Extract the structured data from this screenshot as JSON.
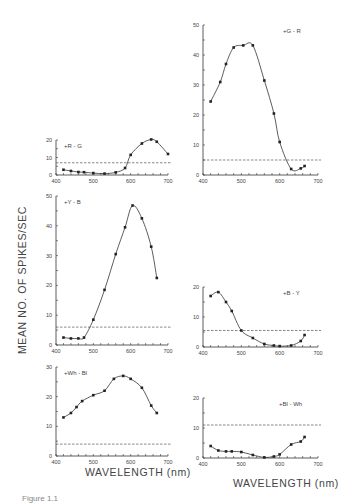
{
  "figure": {
    "ylabel": "MEAN   NO.   OF   SPIKES/SEC",
    "xlabel_left": "WAVELENGTH  (nm)",
    "xlabel_right": "WAVELENGTH  (nm)",
    "caption": "Figure 1.1"
  },
  "chart_data": [
    {
      "type": "line",
      "title": "+R - G",
      "xlabel": "WAVELENGTH (nm)",
      "ylabel": "MEAN NO. OF SPIKES/SEC",
      "xlim": [
        400,
        700
      ],
      "ylim": [
        0,
        20
      ],
      "xticks": [
        400,
        500,
        600,
        700
      ],
      "yticks": [
        0,
        10,
        20
      ],
      "baseline": 7,
      "x": [
        420,
        440,
        460,
        475,
        500,
        530,
        560,
        585,
        600,
        630,
        655,
        670,
        700
      ],
      "values": [
        3,
        2.3,
        1.7,
        1.6,
        1.1,
        0.8,
        1.5,
        4,
        11.5,
        18,
        20.3,
        19,
        12
      ],
      "pixel_box": {
        "x0": 56,
        "x1": 168,
        "y0": 175,
        "y1": 140
      }
    },
    {
      "type": "line",
      "title": "+G - R",
      "xlabel": "WAVELENGTH (nm)",
      "ylabel": "MEAN NO. OF SPIKES/SEC",
      "xlim": [
        400,
        700
      ],
      "ylim": [
        0,
        50
      ],
      "xticks": [
        400,
        500,
        600,
        700
      ],
      "yticks": [
        0,
        10,
        20,
        30,
        40,
        50
      ],
      "baseline": 5,
      "x": [
        420,
        445,
        460,
        480,
        505,
        530,
        560,
        585,
        600,
        630,
        655,
        665
      ],
      "values": [
        24.5,
        31,
        37,
        42.5,
        43.2,
        43.2,
        31.5,
        20.5,
        11,
        2,
        2.2,
        3
      ],
      "pixel_box": {
        "x0": 203,
        "x1": 318,
        "y0": 175,
        "y1": 25
      }
    },
    {
      "type": "line",
      "title": "+Y - B",
      "xlabel": "WAVELENGTH (nm)",
      "ylabel": "MEAN NO. OF SPIKES/SEC",
      "xlim": [
        400,
        700
      ],
      "ylim": [
        0,
        50
      ],
      "xticks": [
        400,
        500,
        600,
        700
      ],
      "yticks": [
        0,
        10,
        20,
        30,
        40,
        50
      ],
      "baseline": 6,
      "x": [
        420,
        440,
        460,
        475,
        500,
        530,
        560,
        585,
        605,
        630,
        655,
        670
      ],
      "values": [
        2.5,
        2.2,
        2.2,
        2.5,
        8.5,
        18.5,
        30.5,
        39.5,
        46.8,
        42.5,
        33,
        22.5
      ],
      "pixel_box": {
        "x0": 56,
        "x1": 168,
        "y0": 345,
        "y1": 196
      }
    },
    {
      "type": "line",
      "title": "+B - Y",
      "xlabel": "WAVELENGTH (nm)",
      "ylabel": "MEAN NO. OF SPIKES/SEC",
      "xlim": [
        400,
        700
      ],
      "ylim": [
        0,
        20
      ],
      "xticks": [
        400,
        500,
        600,
        700
      ],
      "yticks": [
        0,
        10,
        20
      ],
      "baseline": 5.5,
      "x": [
        420,
        440,
        460,
        475,
        500,
        530,
        560,
        585,
        600,
        630,
        655,
        665
      ],
      "values": [
        17,
        18.3,
        15,
        12,
        5.5,
        3,
        1,
        0.5,
        0.3,
        0.5,
        2,
        4
      ],
      "pixel_box": {
        "x0": 203,
        "x1": 318,
        "y0": 347,
        "y1": 287
      }
    },
    {
      "type": "line",
      "title": "+Wh - Bl",
      "xlabel": "WAVELENGTH (nm)",
      "ylabel": "MEAN NO. OF SPIKES/SEC",
      "xlim": [
        400,
        700
      ],
      "ylim": [
        0,
        30
      ],
      "xticks": [
        400,
        500,
        600,
        700
      ],
      "yticks": [
        0,
        10,
        20,
        30
      ],
      "baseline": 4,
      "x": [
        420,
        440,
        455,
        470,
        500,
        530,
        555,
        580,
        600,
        630,
        655,
        670
      ],
      "values": [
        13,
        14.5,
        16.5,
        18.5,
        20.5,
        22,
        26,
        27,
        26,
        23,
        17,
        14.5
      ],
      "pixel_box": {
        "x0": 56,
        "x1": 168,
        "y0": 456,
        "y1": 367
      }
    },
    {
      "type": "line",
      "title": "+Bl - Wh",
      "xlabel": "WAVELENGTH (nm)",
      "ylabel": "MEAN NO. OF SPIKES/SEC",
      "xlim": [
        400,
        700
      ],
      "ylim": [
        0,
        20
      ],
      "xticks": [
        400,
        500,
        600,
        700
      ],
      "yticks": [
        0,
        10,
        20
      ],
      "baseline": 11,
      "x": [
        420,
        440,
        460,
        475,
        500,
        530,
        560,
        585,
        600,
        630,
        655,
        665
      ],
      "values": [
        4,
        2.5,
        2.2,
        2.2,
        2,
        1,
        0.2,
        0.5,
        1.2,
        4.5,
        5.5,
        7
      ],
      "pixel_box": {
        "x0": 203,
        "x1": 318,
        "y0": 458,
        "y1": 398
      }
    }
  ]
}
